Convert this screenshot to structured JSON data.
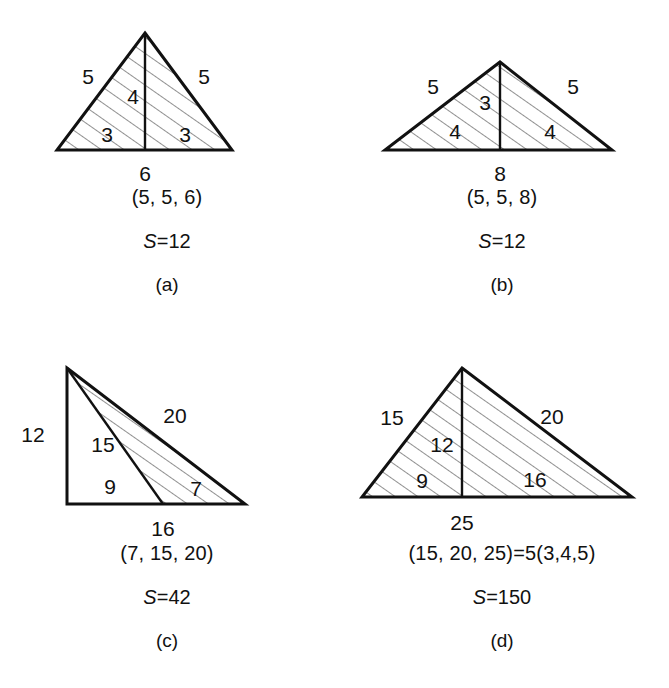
{
  "figure": {
    "background_color": "#ffffff",
    "line_color": "#111111",
    "hatch_color": "#555555"
  },
  "panels": [
    {
      "id": "a",
      "index_label": "(a)",
      "triple_label": "(5, 5, 6)",
      "area_symbol": "S",
      "area_equals": "=12",
      "area_value": 12,
      "shape": "isosceles-triangle",
      "sides": [
        5,
        5,
        6
      ],
      "base": 6,
      "height": 4,
      "dims": {
        "left_side": "5",
        "right_side": "5",
        "altitude": "4",
        "half_base_left": "3",
        "half_base_right": "3",
        "base": "6"
      }
    },
    {
      "id": "b",
      "index_label": "(b)",
      "triple_label": "(5, 5, 8)",
      "area_symbol": "S",
      "area_equals": "=12",
      "area_value": 12,
      "shape": "isosceles-triangle",
      "sides": [
        5,
        5,
        8
      ],
      "base": 8,
      "height": 3,
      "dims": {
        "left_side": "5",
        "right_side": "5",
        "altitude": "3",
        "half_base_left": "4",
        "half_base_right": "4",
        "base": "8"
      }
    },
    {
      "id": "c",
      "index_label": "(c)",
      "triple_label": "(7, 15, 20)",
      "area_symbol": "S",
      "area_equals": "=42",
      "area_value": 42,
      "shape": "right-triangle-with-cevian",
      "sides": [
        7,
        15,
        20
      ],
      "base": 16,
      "height": 12,
      "dims": {
        "vertical_side": "12",
        "cevian": "15",
        "base_left_part": "9",
        "outer_hypotenuse": "20",
        "short_side": "7",
        "base": "16"
      }
    },
    {
      "id": "d",
      "index_label": "(d)",
      "triple_label": "(15, 20, 25)=5(3,4,5)",
      "area_symbol": "S",
      "area_equals": "=150",
      "area_value": 150,
      "shape": "triangle-with-altitude",
      "sides": [
        15,
        20,
        25
      ],
      "base": 25,
      "height": 12,
      "dims": {
        "left_side": "15",
        "right_side": "20",
        "altitude": "12",
        "base_left_part": "9",
        "base_right_part": "16",
        "base": "25"
      }
    }
  ]
}
